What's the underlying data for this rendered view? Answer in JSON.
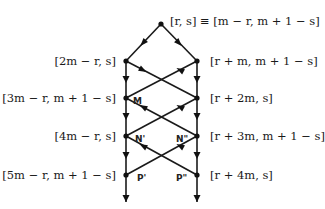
{
  "diagram": {
    "top_label": "[r, s] ≡ [m − r, m + 1 − s]",
    "left_labels": [
      "[2m − r, s]",
      "[3m − r, m + 1 − s]",
      "[4m − r, s]",
      "[5m − r, m + 1 − s]"
    ],
    "right_labels": [
      "[r + m, m + 1 − s]",
      "[r + 2m, s]",
      "[r + 3m, m + 1 − s]",
      "[r + 4m, s]"
    ],
    "node_tags": {
      "M": "M",
      "N1": "N'",
      "N2": "N\"",
      "P1": "P'",
      "P2": "P\""
    },
    "colors": {
      "line": "#1a1a1a",
      "background": "#ffffff"
    }
  }
}
